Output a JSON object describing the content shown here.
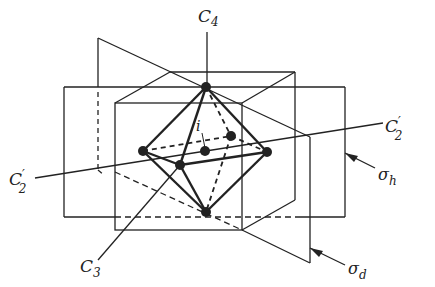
{
  "diagram": {
    "labels": {
      "c4": {
        "main": "C",
        "sub": "4"
      },
      "c2_right": {
        "main": "C",
        "prime": "′",
        "sub": "2"
      },
      "c2_left": {
        "main": "C",
        "prime": "′",
        "sub": "2"
      },
      "c3": {
        "main": "C",
        "sub": "3"
      },
      "sigma_h": {
        "main": "σ",
        "sub": "h"
      },
      "sigma_d": {
        "main": "σ",
        "sub": "d"
      },
      "inversion": "i"
    },
    "colors": {
      "line": "#222222",
      "background": "#ffffff"
    }
  }
}
